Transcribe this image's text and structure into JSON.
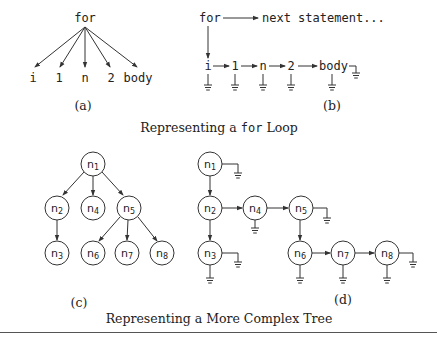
{
  "figure": {
    "panel_a": {
      "label": "(a)",
      "root": "for",
      "children": [
        "i",
        "1",
        "n",
        "2",
        "body"
      ]
    },
    "panel_b": {
      "label": "(b)",
      "root": "for",
      "next": "next statement...",
      "children": [
        "i",
        "1",
        "n",
        "2",
        "body"
      ]
    },
    "caption_top": {
      "prefix": "Representing a ",
      "code": "for",
      "suffix": " Loop"
    },
    "panel_c": {
      "label": "(c)",
      "nodes": [
        {
          "id": "n1",
          "base": "n",
          "sub": "1"
        },
        {
          "id": "n2",
          "base": "n",
          "sub": "2"
        },
        {
          "id": "n3",
          "base": "n",
          "sub": "3"
        },
        {
          "id": "n4",
          "base": "n",
          "sub": "4"
        },
        {
          "id": "n5",
          "base": "n",
          "sub": "5"
        },
        {
          "id": "n6",
          "base": "n",
          "sub": "6"
        },
        {
          "id": "n7",
          "base": "n",
          "sub": "7"
        },
        {
          "id": "n8",
          "base": "n",
          "sub": "8"
        }
      ]
    },
    "panel_d": {
      "label": "(d)",
      "nodes": [
        {
          "id": "n1",
          "base": "n",
          "sub": "1"
        },
        {
          "id": "n2",
          "base": "n",
          "sub": "2"
        },
        {
          "id": "n3",
          "base": "n",
          "sub": "3"
        },
        {
          "id": "n4",
          "base": "n",
          "sub": "4"
        },
        {
          "id": "n5",
          "base": "n",
          "sub": "5"
        },
        {
          "id": "n6",
          "base": "n",
          "sub": "6"
        },
        {
          "id": "n7",
          "base": "n",
          "sub": "7"
        },
        {
          "id": "n8",
          "base": "n",
          "sub": "8"
        }
      ]
    },
    "caption_bottom": "Representing a More Complex Tree"
  }
}
